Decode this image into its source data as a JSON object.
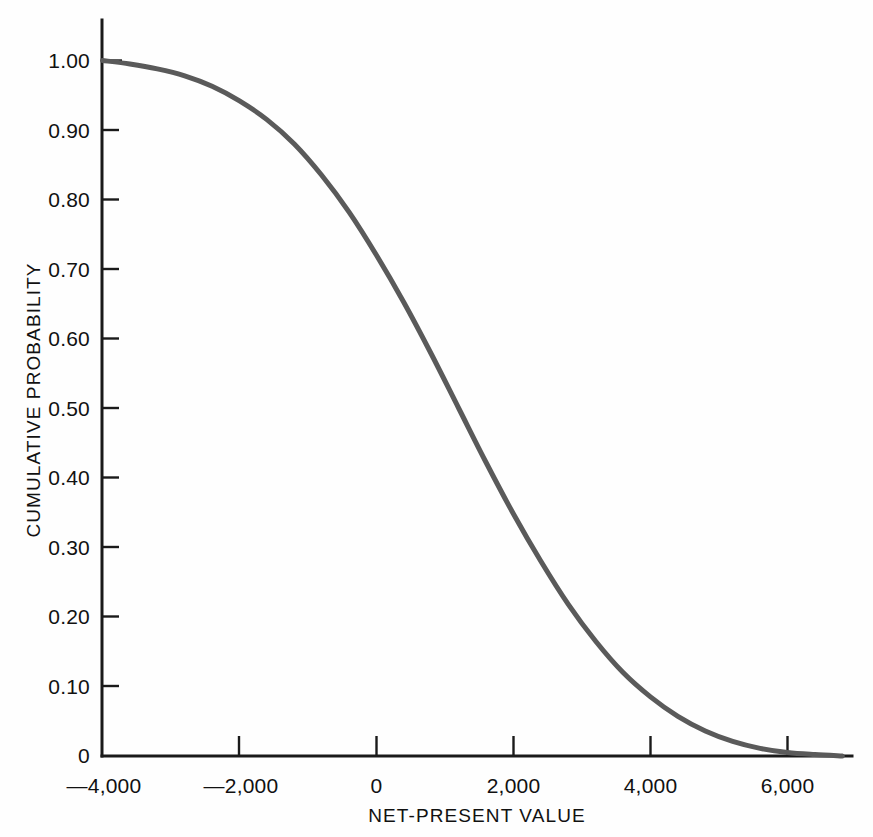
{
  "chart_data": {
    "type": "line",
    "title": "",
    "subtitle": "",
    "xlabel": "NET-PRESENT VALUE",
    "ylabel": "CUMULATIVE PROBABILITY",
    "xlim": [
      -4000,
      6800
    ],
    "ylim": [
      0,
      1.0
    ],
    "grid": false,
    "legend": null,
    "xticks": [
      -4000,
      -2000,
      0,
      2000,
      4000,
      6000
    ],
    "xtick_labels": [
      "—4,000",
      "—2,000",
      "0",
      "2,000",
      "4,000",
      "6,000"
    ],
    "yticks": [
      0,
      0.1,
      0.2,
      0.3,
      0.4,
      0.5,
      0.6,
      0.7,
      0.8,
      0.9,
      1.0
    ],
    "ytick_labels": [
      "0",
      "0.10",
      "0.20",
      "0.30",
      "0.40",
      "0.50",
      "0.60",
      "0.70",
      "0.80",
      "0.90",
      "1.00"
    ],
    "series": [
      {
        "name": "Cumulative probability",
        "color": "#5a5a5a",
        "x": [
          -4000,
          -3600,
          -3200,
          -2800,
          -2400,
          -2000,
          -1600,
          -1200,
          -800,
          -400,
          0,
          400,
          800,
          1200,
          1600,
          2000,
          2400,
          2800,
          3200,
          3600,
          4000,
          4400,
          4800,
          5200,
          5600,
          6000,
          6400,
          6800
        ],
        "y": [
          1.0,
          0.995,
          0.988,
          0.978,
          0.963,
          0.942,
          0.915,
          0.88,
          0.835,
          0.782,
          0.72,
          0.652,
          0.578,
          0.5,
          0.422,
          0.348,
          0.28,
          0.218,
          0.165,
          0.12,
          0.085,
          0.057,
          0.036,
          0.021,
          0.011,
          0.005,
          0.002,
          0.0
        ]
      }
    ],
    "annotations": []
  },
  "axes": {
    "x_axis_name": "x-axis",
    "y_axis_name": "y-axis"
  }
}
